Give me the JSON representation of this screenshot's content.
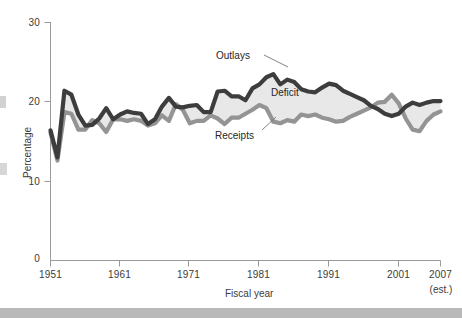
{
  "chart_data": {
    "type": "area",
    "title": "",
    "xlabel": "Fiscal year",
    "ylabel": "Percentage",
    "xlim": [
      1951,
      2007
    ],
    "ylim": [
      0,
      30
    ],
    "yticks": [
      0,
      10,
      20,
      30
    ],
    "ytick_labels": [
      "0",
      "10",
      "20",
      "30"
    ],
    "xticks": [
      1951,
      1961,
      1971,
      1981,
      1991,
      2001,
      2007
    ],
    "xtick_labels": [
      "1951",
      "1961",
      "1971",
      "1981",
      "1991",
      "2001",
      "2007"
    ],
    "last_tick_note": "(est.)",
    "grid": false,
    "legend_position": "inline-annotations",
    "annotations": [
      {
        "text": "Outlays",
        "series": "outlays"
      },
      {
        "text": "Deficit",
        "series": "gap-fill"
      },
      {
        "text": "Receipts",
        "series": "receipts"
      }
    ],
    "colors": {
      "outlays_line": "#3b3b3b",
      "receipts_line": "#8f8f8f",
      "deficit_fill": "#e6e6e6",
      "axis": "#9a9a9a",
      "text": "#3b3b3b"
    },
    "x": [
      1951,
      1952,
      1953,
      1954,
      1955,
      1956,
      1957,
      1958,
      1959,
      1960,
      1961,
      1962,
      1963,
      1964,
      1965,
      1966,
      1967,
      1968,
      1969,
      1970,
      1971,
      1972,
      1973,
      1974,
      1975,
      1976,
      1977,
      1978,
      1979,
      1980,
      1981,
      1982,
      1983,
      1984,
      1985,
      1986,
      1987,
      1988,
      1989,
      1990,
      1991,
      1992,
      1993,
      1994,
      1995,
      1996,
      1997,
      1998,
      1999,
      2000,
      2001,
      2002,
      2003,
      2004,
      2005,
      2006,
      2007
    ],
    "series": [
      {
        "name": "Outlays",
        "values": [
          16.4,
          13.0,
          21.4,
          20.9,
          18.4,
          17.0,
          17.1,
          17.9,
          19.2,
          17.8,
          18.4,
          18.8,
          18.6,
          18.5,
          17.2,
          17.8,
          19.4,
          20.5,
          19.4,
          19.3,
          19.5,
          19.6,
          18.7,
          18.7,
          21.3,
          21.4,
          20.7,
          20.7,
          20.2,
          21.7,
          22.2,
          23.1,
          23.5,
          22.2,
          22.8,
          22.5,
          21.6,
          21.3,
          21.2,
          21.8,
          22.3,
          22.1,
          21.4,
          21.0,
          20.6,
          20.2,
          19.5,
          19.1,
          18.5,
          18.2,
          18.5,
          19.4,
          19.9,
          19.6,
          19.9,
          20.1,
          20.1
        ]
      },
      {
        "name": "Receipts",
        "values": [
          16.1,
          12.6,
          18.7,
          18.5,
          16.5,
          16.5,
          17.7,
          17.3,
          16.2,
          17.8,
          17.8,
          17.6,
          17.8,
          17.6,
          17.0,
          17.3,
          18.3,
          17.6,
          19.7,
          19.0,
          17.3,
          17.6,
          17.6,
          18.3,
          17.9,
          17.2,
          18.0,
          18.0,
          18.5,
          19.0,
          19.6,
          19.2,
          17.5,
          17.3,
          17.7,
          17.5,
          18.4,
          18.2,
          18.4,
          18.0,
          17.8,
          17.5,
          17.6,
          18.1,
          18.5,
          18.9,
          19.3,
          19.9,
          20.0,
          20.9,
          19.8,
          17.9,
          16.5,
          16.3,
          17.6,
          18.4,
          18.8
        ]
      }
    ]
  },
  "axes": {
    "ylabel": "Percentage",
    "xlabel": "Fiscal year",
    "ytick_0": "0",
    "ytick_10": "10",
    "ytick_20": "20",
    "ytick_30": "30",
    "xtick_1951": "1951",
    "xtick_1961": "1961",
    "xtick_1971": "1971",
    "xtick_1981": "1981",
    "xtick_1991": "1991",
    "xtick_2001": "2001",
    "xtick_2007": "2007",
    "est_note": "(est.)"
  },
  "labels": {
    "outlays": "Outlays",
    "deficit": "Deficit",
    "receipts": "Receipts"
  }
}
